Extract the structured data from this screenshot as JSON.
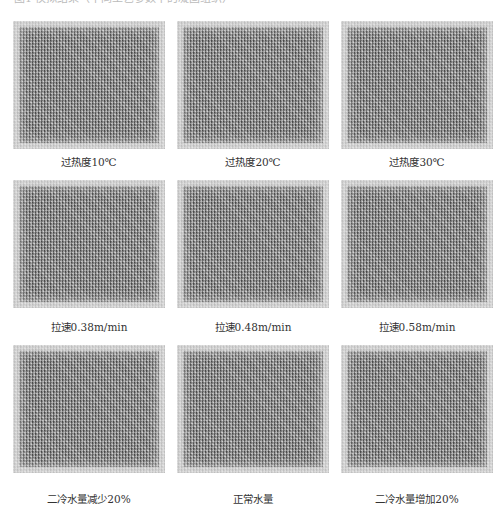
{
  "figure": {
    "top_text": "图1 模拟结果（不同工艺参数下的凝固组织）",
    "panels": [
      {
        "caption": "过热度10℃"
      },
      {
        "caption": "过热度20℃"
      },
      {
        "caption": "过热度30℃"
      },
      {
        "caption": "拉速0.38m/min"
      },
      {
        "caption": "拉速0.48m/min"
      },
      {
        "caption": "拉速0.58m/min"
      },
      {
        "caption": "二冷水量减少20%"
      },
      {
        "caption": "正常水量"
      },
      {
        "caption": "二冷水量增加20%"
      }
    ]
  }
}
